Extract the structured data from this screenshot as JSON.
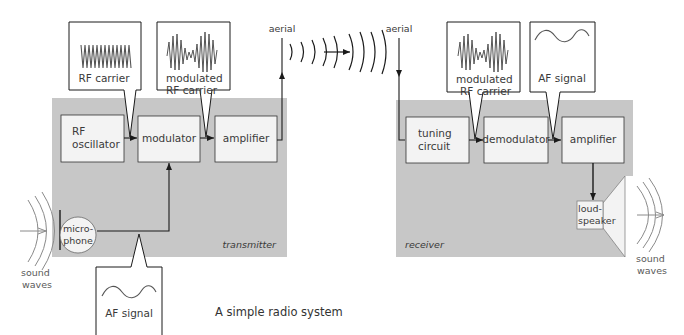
{
  "caption": "A simple radio system",
  "colors": {
    "panel": "#c7c7c7",
    "box_fill": "#f3f3f3",
    "line": "#1a1a1a",
    "wave": "#555555",
    "sound_wave": "#8a8a8a"
  },
  "transmitter": {
    "label": "transmitter",
    "blocks": {
      "rf_oscillator": [
        "RF",
        "oscillator"
      ],
      "modulator": "modulator",
      "amplifier": "amplifier"
    },
    "microphone": [
      "micro-",
      "phone"
    ],
    "sound_waves": [
      "sound",
      "waves"
    ],
    "aerial": "aerial",
    "callouts": {
      "rf_carrier": "RF carrier",
      "modulated_rf_carrier": [
        "modulated",
        "RF carrier"
      ],
      "af_signal": "AF signal"
    }
  },
  "receiver": {
    "label": "receiver",
    "blocks": {
      "tuning_circuit": [
        "tuning",
        "circuit"
      ],
      "demodulator": "demodulator",
      "amplifier": "amplifier"
    },
    "loudspeaker": [
      "loud-",
      "speaker"
    ],
    "sound_waves": [
      "sound",
      "waves"
    ],
    "aerial": "aerial",
    "callouts": {
      "modulated_rf_carrier": [
        "modulated",
        "RF carrier"
      ],
      "af_signal": "AF signal"
    }
  }
}
